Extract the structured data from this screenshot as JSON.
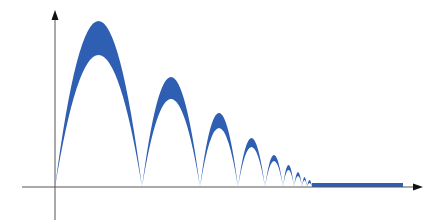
{
  "diagram": {
    "type": "bouncing-ball-trajectory-envelope",
    "colors": {
      "fill": "#2f5fb2",
      "axis": "#555555",
      "background": "#ffffff"
    },
    "axes": {
      "origin": {
        "x": 55,
        "y": 187
      },
      "y_axis": {
        "x": 55,
        "top": 10,
        "bottom": 220
      },
      "x_axis": {
        "y": 187,
        "left": 22,
        "right": 423
      }
    },
    "arcs": [
      {
        "x0": 55,
        "x1": 142,
        "peak_outer": 21,
        "peak_inner": 55
      },
      {
        "x0": 142,
        "x1": 200,
        "peak_outer": 77,
        "peak_inner": 99
      },
      {
        "x0": 200,
        "x1": 238,
        "peak_outer": 113,
        "peak_inner": 128
      },
      {
        "x0": 238,
        "x1": 265,
        "peak_outer": 138,
        "peak_inner": 147
      },
      {
        "x0": 265,
        "x1": 283,
        "peak_outer": 155,
        "peak_inner": 161
      },
      {
        "x0": 283,
        "x1": 294,
        "peak_outer": 165,
        "peak_inner": 170
      },
      {
        "x0": 294,
        "x1": 302,
        "peak_outer": 172,
        "peak_inner": 176
      },
      {
        "x0": 302,
        "x1": 307,
        "peak_outer": 177,
        "peak_inner": 180
      },
      {
        "x0": 307,
        "x1": 312,
        "peak_outer": 180,
        "peak_inner": 183
      }
    ],
    "rest_band": {
      "x0": 312,
      "x1": 403,
      "top": 183,
      "bottom": 187
    }
  }
}
